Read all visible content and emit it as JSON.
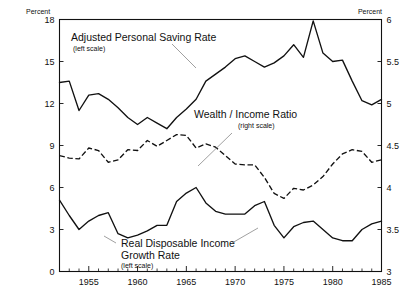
{
  "chart_data": {
    "type": "line",
    "title": "",
    "xlabel": "",
    "ylabel": "Percent",
    "y2label": "Percent",
    "xlim": [
      1952,
      1985
    ],
    "ylim": [
      0,
      18
    ],
    "y2lim": [
      3,
      6
    ],
    "grid": false,
    "legend_position": "inline-annotations",
    "x_ticks_major": [
      1955,
      1960,
      1965,
      1970,
      1975,
      1980,
      1985
    ],
    "x_ticks_major_labels": [
      "1955",
      "1960",
      "1965",
      "1970",
      "1975",
      "1980",
      "1985"
    ],
    "x_ticks_minor_step": 1,
    "y_ticks_left": [
      0,
      3,
      6,
      9,
      12,
      15,
      18
    ],
    "y_ticks_left_labels": [
      "0",
      "3",
      "6",
      "9",
      "12",
      "15",
      "18"
    ],
    "y_ticks_right": [
      3,
      3.5,
      4,
      4.5,
      5,
      5.5,
      6
    ],
    "y_ticks_right_labels": [
      "3",
      "3.5",
      "4",
      "4.5",
      "5",
      "5.5",
      "6"
    ],
    "x": [
      1952,
      1953,
      1954,
      1955,
      1956,
      1957,
      1958,
      1959,
      1960,
      1961,
      1962,
      1963,
      1964,
      1965,
      1966,
      1967,
      1968,
      1969,
      1970,
      1971,
      1972,
      1973,
      1974,
      1975,
      1976,
      1977,
      1978,
      1979,
      1980,
      1981,
      1982,
      1983,
      1984,
      1985
    ],
    "series": [
      {
        "name": "Adjusted Personal Saving Rate",
        "scale": "left",
        "style": "solid",
        "units": "percent",
        "values": [
          13.5,
          13.6,
          11.5,
          12.6,
          12.7,
          12.3,
          11.7,
          11.0,
          10.5,
          11.0,
          10.6,
          10.2,
          11.0,
          11.6,
          12.3,
          13.6,
          14.1,
          14.6,
          15.2,
          15.4,
          15.0,
          14.6,
          14.9,
          15.4,
          16.2,
          15.3,
          17.9,
          15.6,
          15.0,
          15.1,
          13.6,
          12.2,
          11.9,
          12.3
        ]
      },
      {
        "name": "Wealth / Income Ratio",
        "scale": "right",
        "style": "dashed",
        "units": "ratio",
        "values": [
          4.38,
          4.35,
          4.34,
          4.47,
          4.44,
          4.3,
          4.33,
          4.45,
          4.44,
          4.56,
          4.49,
          4.56,
          4.63,
          4.62,
          4.47,
          4.52,
          4.48,
          4.38,
          4.28,
          4.27,
          4.27,
          4.12,
          3.93,
          3.87,
          3.99,
          3.97,
          4.03,
          4.13,
          4.28,
          4.4,
          4.45,
          4.43,
          4.3,
          4.33
        ]
      },
      {
        "name": "Real Disposable Income Growth Rate",
        "scale": "left",
        "style": "solid",
        "units": "percent",
        "values": [
          5.1,
          4.0,
          3.0,
          3.6,
          4.0,
          4.2,
          2.7,
          2.4,
          2.6,
          2.9,
          3.3,
          3.3,
          5.0,
          5.6,
          6.0,
          4.9,
          4.3,
          4.1,
          4.1,
          4.1,
          4.7,
          5.0,
          3.3,
          2.4,
          3.2,
          3.5,
          3.6,
          3.0,
          2.4,
          2.2,
          2.2,
          3.0,
          3.4,
          3.6
        ]
      }
    ],
    "annotations": [
      {
        "id": "ann-saving",
        "line1": "Adjusted Personal Saving Rate",
        "line2": "(left scale)"
      },
      {
        "id": "ann-wealth",
        "line1": "Wealth / Income Ratio",
        "line2": "(right scale)"
      },
      {
        "id": "ann-income",
        "line1": "Real Disposable Income",
        "line1b": "Growth Rate",
        "line2": "(left scale)"
      }
    ]
  }
}
